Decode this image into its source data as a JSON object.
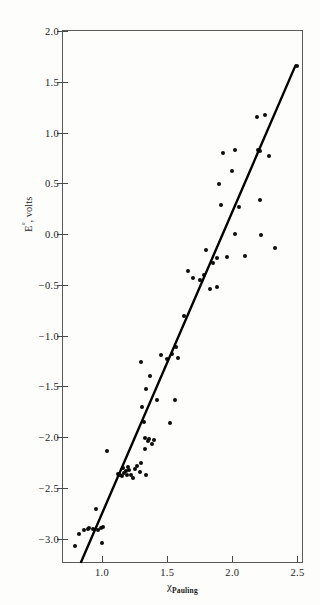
{
  "chart_data": {
    "type": "scatter",
    "title": "",
    "subtitle": "",
    "xlabel": "χ",
    "xlabel_sub": "Pauling",
    "ylabel": "E°, volts",
    "xlim": [
      0.7,
      2.55
    ],
    "ylim": [
      -3.25,
      2.0
    ],
    "grid": false,
    "legend": null,
    "xticks": [
      "1.0",
      "1.5",
      "2.0",
      "2.5"
    ],
    "xtick_values": [
      1.0,
      1.5,
      2.0,
      2.5
    ],
    "yticks": [
      "2.0",
      "1.5",
      "1.0",
      "0.5",
      "0.0",
      "−0.5",
      "−1.0",
      "−1.5",
      "−2.0",
      "−2.5",
      "−3.0"
    ],
    "ytick_values": [
      2.0,
      1.5,
      1.0,
      0.5,
      0.0,
      -0.5,
      -1.0,
      -1.5,
      -2.0,
      -2.5,
      -3.0
    ],
    "marker_color": "#0c0c0c",
    "line_color": "#000000",
    "axis_color": "#4a4a4a",
    "background_color": "#fdfdfc",
    "series": [
      {
        "name": "E° vs electronegativity",
        "marker": "filled-circle",
        "points": [
          [
            0.79,
            -3.07
          ],
          [
            0.82,
            -2.95
          ],
          [
            0.86,
            -2.92
          ],
          [
            0.89,
            -2.91
          ],
          [
            0.9,
            -2.9
          ],
          [
            0.93,
            -2.91
          ],
          [
            0.95,
            -2.71
          ],
          [
            0.97,
            -2.92
          ],
          [
            0.99,
            -2.9
          ],
          [
            1.0,
            -3.04
          ],
          [
            1.01,
            -2.89
          ],
          [
            1.04,
            -2.14
          ],
          [
            1.12,
            -2.36
          ],
          [
            1.14,
            -2.37
          ],
          [
            1.15,
            -2.38
          ],
          [
            1.16,
            -2.3
          ],
          [
            1.17,
            -2.35
          ],
          [
            1.18,
            -2.33
          ],
          [
            1.19,
            -2.37
          ],
          [
            1.2,
            -2.29
          ],
          [
            1.21,
            -2.32
          ],
          [
            1.22,
            -2.37
          ],
          [
            1.24,
            -2.4
          ],
          [
            1.25,
            -2.31
          ],
          [
            1.27,
            -2.28
          ],
          [
            1.29,
            -2.34
          ],
          [
            1.3,
            -2.26
          ],
          [
            1.3,
            -1.26
          ],
          [
            1.31,
            -1.7
          ],
          [
            1.32,
            -1.85
          ],
          [
            1.33,
            -2.01
          ],
          [
            1.33,
            -2.12
          ],
          [
            1.34,
            -2.37
          ],
          [
            1.34,
            -1.53
          ],
          [
            1.35,
            -2.04
          ],
          [
            1.36,
            -2.02
          ],
          [
            1.37,
            -1.4
          ],
          [
            1.38,
            -2.07
          ],
          [
            1.4,
            -2.03
          ],
          [
            1.42,
            -1.63
          ],
          [
            1.45,
            -1.19
          ],
          [
            1.5,
            -1.23
          ],
          [
            1.52,
            -1.86
          ],
          [
            1.54,
            -1.18
          ],
          [
            1.56,
            -1.63
          ],
          [
            1.57,
            -1.11
          ],
          [
            1.58,
            -1.22
          ],
          [
            1.63,
            -0.81
          ],
          [
            1.66,
            -0.36
          ],
          [
            1.7,
            -0.43
          ],
          [
            1.75,
            -0.45
          ],
          [
            1.78,
            -0.4
          ],
          [
            1.8,
            -0.16
          ],
          [
            1.83,
            -0.54
          ],
          [
            1.85,
            -0.29
          ],
          [
            1.88,
            -0.52
          ],
          [
            1.88,
            -0.24
          ],
          [
            1.9,
            0.49
          ],
          [
            1.91,
            0.29
          ],
          [
            1.93,
            0.8
          ],
          [
            1.96,
            -0.23
          ],
          [
            2.0,
            0.62
          ],
          [
            2.02,
            0.83
          ],
          [
            2.02,
            0.0
          ],
          [
            2.05,
            0.27
          ],
          [
            2.1,
            -0.22
          ],
          [
            2.19,
            1.15
          ],
          [
            2.2,
            0.83
          ],
          [
            2.21,
            0.82
          ],
          [
            2.21,
            0.34
          ],
          [
            2.22,
            -0.01
          ],
          [
            2.25,
            1.17
          ],
          [
            2.28,
            0.77
          ],
          [
            2.33,
            -0.14
          ],
          [
            2.5,
            1.66
          ]
        ]
      }
    ],
    "fit_line": {
      "name": "least-squares fit",
      "x_start": 0.84,
      "y_start": -3.25,
      "x_end": 2.5,
      "y_end": 1.66,
      "style": "solid",
      "width_px": 2.4
    }
  }
}
